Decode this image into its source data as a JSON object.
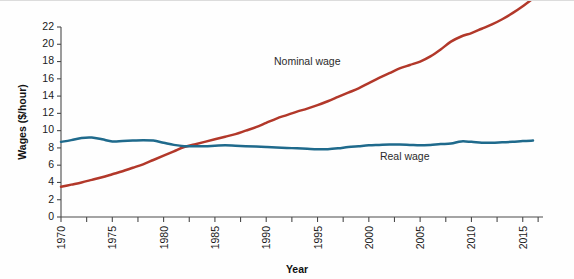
{
  "chart_data": {
    "type": "line",
    "title": "",
    "xlabel": "Year",
    "ylabel": "Wages ($/hour)",
    "xlim": [
      1970,
      2016
    ],
    "ylim": [
      0,
      22
    ],
    "grid": false,
    "legend_position": "inline-annotations",
    "y_ticks": [
      0,
      2,
      4,
      6,
      8,
      10,
      12,
      14,
      16,
      18,
      20,
      22
    ],
    "x_ticks": [
      1970,
      1975,
      1980,
      1985,
      1990,
      1995,
      2000,
      2005,
      2010,
      2015
    ],
    "x_minor_ticks": [
      1970,
      1972.5,
      1975,
      1977.5,
      1980,
      1982.5,
      1985,
      1987.5,
      1990,
      1992.5,
      1995,
      1997.5,
      2000,
      2002.5,
      2005,
      2007.5,
      2010,
      2012.5,
      2015,
      2016.5
    ],
    "x": [
      1970,
      1971,
      1972,
      1973,
      1974,
      1975,
      1976,
      1977,
      1978,
      1979,
      1980,
      1981,
      1982,
      1983,
      1984,
      1985,
      1986,
      1987,
      1988,
      1989,
      1990,
      1991,
      1992,
      1993,
      1994,
      1995,
      1996,
      1997,
      1998,
      1999,
      2000,
      2001,
      2002,
      2003,
      2004,
      2005,
      2006,
      2007,
      2008,
      2009,
      2010,
      2011,
      2012,
      2013,
      2014,
      2015,
      2016
    ],
    "series": [
      {
        "name": "Nominal wage",
        "color": "#b2382a",
        "values": [
          3.5,
          3.75,
          4.0,
          4.3,
          4.6,
          4.95,
          5.3,
          5.7,
          6.1,
          6.6,
          7.1,
          7.6,
          8.1,
          8.4,
          8.7,
          9.0,
          9.3,
          9.6,
          10.0,
          10.4,
          10.9,
          11.4,
          11.8,
          12.2,
          12.55,
          12.95,
          13.4,
          13.9,
          14.4,
          14.9,
          15.5,
          16.1,
          16.65,
          17.2,
          17.6,
          18.0,
          18.6,
          19.4,
          20.3,
          20.9,
          21.3,
          21.8,
          22.3,
          22.9,
          23.6,
          24.4,
          25.3
        ]
      },
      {
        "name": "Real wage",
        "color": "#1f6a8c",
        "values": [
          8.7,
          8.9,
          9.15,
          9.2,
          9.0,
          8.75,
          8.8,
          8.85,
          8.9,
          8.85,
          8.6,
          8.35,
          8.2,
          8.2,
          8.2,
          8.25,
          8.3,
          8.25,
          8.2,
          8.15,
          8.1,
          8.05,
          8.0,
          7.95,
          7.9,
          7.85,
          7.85,
          7.95,
          8.1,
          8.2,
          8.3,
          8.35,
          8.4,
          8.4,
          8.35,
          8.3,
          8.35,
          8.45,
          8.5,
          8.75,
          8.7,
          8.6,
          8.6,
          8.65,
          8.7,
          8.8,
          8.85
        ]
      }
    ],
    "annotations": [
      {
        "text": "Nominal wage",
        "x": 1994,
        "y": 17.6
      },
      {
        "text": "Real wage",
        "x": 2003.5,
        "y": 6.6
      }
    ]
  }
}
